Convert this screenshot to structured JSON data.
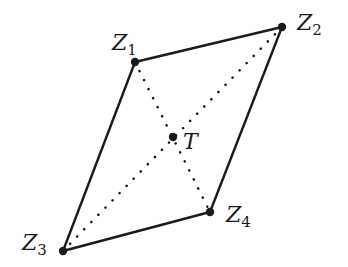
{
  "diagram": {
    "type": "parallelogram-with-diagonals",
    "colors": {
      "stroke": "#1a1a1a",
      "background": "#ffffff"
    },
    "vertices": [
      {
        "id": "Z1",
        "letter": "Z",
        "sub": "1",
        "x": 135,
        "y": 62,
        "label_x": 112,
        "label_y": 50
      },
      {
        "id": "Z2",
        "letter": "Z",
        "sub": "2",
        "x": 282,
        "y": 27,
        "label_x": 297,
        "label_y": 30
      },
      {
        "id": "Z3",
        "letter": "Z",
        "sub": "3",
        "x": 63,
        "y": 251,
        "label_x": 22,
        "label_y": 250
      },
      {
        "id": "Z4",
        "letter": "Z",
        "sub": "4",
        "x": 210,
        "y": 212,
        "label_x": 226,
        "label_y": 222
      }
    ],
    "center": {
      "id": "T",
      "label": "T",
      "x": 173,
      "y": 137,
      "label_x": 183,
      "label_y": 149
    },
    "edges": [
      {
        "from": "Z1",
        "to": "Z2",
        "style": "solid"
      },
      {
        "from": "Z2",
        "to": "Z4",
        "style": "solid"
      },
      {
        "from": "Z4",
        "to": "Z3",
        "style": "solid"
      },
      {
        "from": "Z3",
        "to": "Z1",
        "style": "solid"
      }
    ],
    "diagonals": [
      {
        "from": "Z1",
        "to": "Z4",
        "style": "dotted"
      },
      {
        "from": "Z2",
        "to": "Z3",
        "style": "dotted"
      }
    ]
  }
}
